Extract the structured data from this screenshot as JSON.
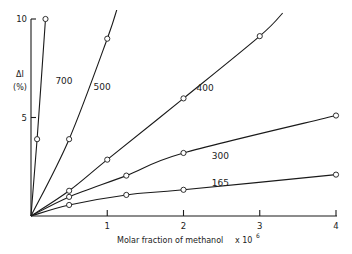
{
  "chart_data": {
    "type": "line",
    "title": "",
    "xlabel": "Molar fraction of methanol",
    "xlabel_multiplier": "x 10",
    "xlabel_exponent": "6",
    "ylabel": "ΔI",
    "ylabel_unit": "(%)",
    "xlim": [
      0,
      4
    ],
    "ylim": [
      0,
      10
    ],
    "x_ticks": [
      1,
      2,
      3,
      4
    ],
    "y_ticks": [
      5,
      10
    ],
    "grid": false,
    "legend": "inline labels",
    "series": [
      {
        "name": "700",
        "points": [
          [
            0,
            0
          ],
          [
            0.08,
            3.9
          ],
          [
            0.19,
            10.0
          ]
        ]
      },
      {
        "name": "500",
        "points": [
          [
            0,
            0
          ],
          [
            0.5,
            3.9
          ],
          [
            1.0,
            9.0
          ],
          [
            1.15,
            10.8
          ]
        ]
      },
      {
        "name": "400",
        "points": [
          [
            0,
            0
          ],
          [
            0.5,
            1.28
          ],
          [
            1.0,
            2.86
          ],
          [
            2.0,
            5.97
          ],
          [
            3.0,
            9.13
          ],
          [
            3.3,
            10.3
          ]
        ]
      },
      {
        "name": "300",
        "points": [
          [
            0,
            0
          ],
          [
            0.5,
            0.97
          ],
          [
            1.25,
            2.05
          ],
          [
            2.0,
            3.2
          ],
          [
            4.0,
            5.1
          ]
        ]
      },
      {
        "name": "165",
        "points": [
          [
            0,
            0
          ],
          [
            0.5,
            0.56
          ],
          [
            1.25,
            1.07
          ],
          [
            2.0,
            1.33
          ],
          [
            4.0,
            2.1
          ]
        ]
      }
    ],
    "markers": {
      "700": [
        [
          0.08,
          3.9
        ],
        [
          0.19,
          10.0
        ]
      ],
      "500": [
        [
          0.5,
          3.9
        ],
        [
          1.0,
          9.0
        ]
      ],
      "400": [
        [
          0.5,
          1.28
        ],
        [
          1.0,
          2.86
        ],
        [
          2.0,
          5.97
        ],
        [
          3.0,
          9.13
        ]
      ],
      "300": [
        [
          0.5,
          0.97
        ],
        [
          1.25,
          2.05
        ],
        [
          2.0,
          3.2
        ],
        [
          4.0,
          5.1
        ]
      ],
      "165": [
        [
          0.5,
          0.56
        ],
        [
          1.25,
          1.07
        ],
        [
          2.0,
          1.33
        ],
        [
          4.0,
          2.1
        ]
      ]
    },
    "label_positions": {
      "700": [
        0.32,
        6.7
      ],
      "500": [
        0.82,
        6.4
      ],
      "400": [
        2.17,
        6.35
      ],
      "300": [
        2.37,
        2.9
      ],
      "165": [
        2.37,
        1.5
      ]
    }
  }
}
